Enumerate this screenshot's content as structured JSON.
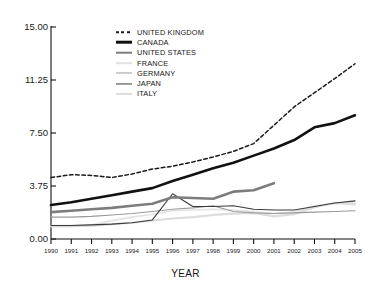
{
  "chart_data": {
    "type": "line",
    "title": "",
    "xlabel": "YEAR",
    "ylabel": "",
    "grid": false,
    "legend_position": "top-center",
    "x": [
      1990,
      1991,
      1992,
      1993,
      1994,
      1995,
      1996,
      1997,
      1998,
      1999,
      2000,
      2001,
      2002,
      2003,
      2004,
      2005
    ],
    "xlim": [
      1990,
      2005
    ],
    "ylim": [
      0.0,
      15.0
    ],
    "yticks": [
      0.0,
      3.75,
      7.5,
      11.25,
      15.0
    ],
    "ytick_labels": [
      "0.00",
      "3.75",
      "7.50",
      "11.25",
      "15.00"
    ],
    "xtick_labels": [
      "1990",
      "1991",
      "1992",
      "1993",
      "1994",
      "1995",
      "1996",
      "1997",
      "1998",
      "1999",
      "2000",
      "2001",
      "2002",
      "2003",
      "2004",
      "2005"
    ],
    "series": [
      {
        "name": "UNITED KINGDOM",
        "style": "dashed",
        "color": "#1a1a1a",
        "width": 1.5,
        "values": [
          4.35,
          4.55,
          4.5,
          4.35,
          4.6,
          4.95,
          5.15,
          5.45,
          5.8,
          6.2,
          6.75,
          8.05,
          9.35,
          10.35,
          11.35,
          12.4
        ]
      },
      {
        "name": "CANADA",
        "style": "solid",
        "color": "#111111",
        "width": 2.6,
        "values": [
          2.4,
          2.6,
          2.85,
          3.1,
          3.35,
          3.6,
          4.1,
          4.55,
          5.0,
          5.4,
          5.9,
          6.4,
          7.0,
          7.9,
          8.2,
          8.75
        ]
      },
      {
        "name": "UNITED STATES",
        "style": "solid",
        "color": "#7d7d7d",
        "width": 2.6,
        "values": [
          1.9,
          2.0,
          2.1,
          2.2,
          2.35,
          2.5,
          2.95,
          2.9,
          2.85,
          3.35,
          3.45,
          3.95,
          null,
          null,
          null,
          null
        ]
      },
      {
        "name": "FRANCE",
        "style": "solid",
        "color": "#e3e3e3",
        "width": 1.6,
        "values": [
          0.95,
          0.95,
          1.0,
          1.3,
          1.55,
          1.75,
          2.0,
          2.05,
          2.1,
          2.05,
          1.95,
          1.8,
          1.9,
          2.35,
          2.5,
          2.6
        ]
      },
      {
        "name": "GERMANY",
        "style": "solid",
        "color": "#9a9a9a",
        "width": 1.1,
        "values": [
          1.55,
          1.55,
          1.6,
          1.7,
          1.8,
          1.95,
          2.1,
          2.2,
          2.35,
          1.95,
          1.85,
          1.8,
          1.85,
          1.9,
          1.95,
          2.0
        ]
      },
      {
        "name": "JAPAN",
        "style": "solid",
        "color": "#3a3a3a",
        "width": 1.1,
        "values": [
          0.95,
          0.95,
          1.0,
          1.05,
          1.15,
          1.35,
          3.2,
          2.3,
          2.3,
          2.35,
          2.1,
          2.05,
          2.05,
          2.3,
          2.55,
          2.7
        ]
      },
      {
        "name": "ITALY",
        "style": "solid",
        "color": "#dcdcdc",
        "width": 2.2,
        "values": [
          0.9,
          0.9,
          0.95,
          1.05,
          1.15,
          1.3,
          1.45,
          1.55,
          1.7,
          1.8,
          1.85,
          1.6,
          1.75,
          2.25,
          2.55,
          2.45
        ]
      }
    ]
  }
}
